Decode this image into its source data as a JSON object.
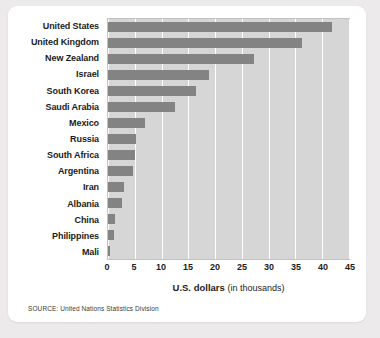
{
  "chart_data": {
    "type": "bar",
    "orientation": "horizontal",
    "title": "",
    "xlabel": "U.S. dollars (in thousands)",
    "ylabel": "",
    "xlim": [
      0,
      45
    ],
    "xticks": [
      0,
      5,
      10,
      15,
      20,
      25,
      30,
      35,
      40,
      45
    ],
    "grid": true,
    "legend": false,
    "categories": [
      "United States",
      "United Kingdom",
      "New Zealand",
      "Israel",
      "South Korea",
      "Saudi Arabia",
      "Mexico",
      "Russia",
      "South Africa",
      "Argentina",
      "Iran",
      "Albania",
      "China",
      "Philippines",
      "Mali"
    ],
    "values": [
      41.8,
      36.3,
      27.2,
      18.9,
      16.5,
      12.6,
      7.0,
      5.3,
      5.1,
      4.6,
      3.0,
      2.7,
      1.4,
      1.1,
      0.3
    ],
    "bar_color": "#838383",
    "plot_background": "#d6d6d6",
    "gridline_color": "#ffffff"
  },
  "axis_title": {
    "strong": "U.S. dollars",
    "light": "(in thousands)"
  },
  "source": {
    "text": "SOURCE: United Nations Statistics Division"
  }
}
